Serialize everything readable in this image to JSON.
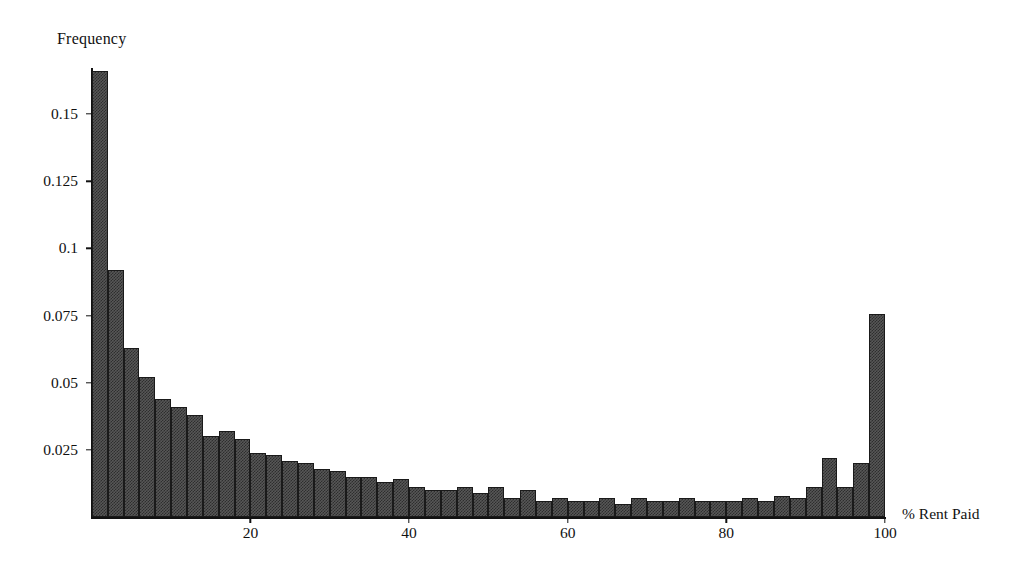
{
  "chart_data": {
    "type": "bar",
    "title": "Frequency",
    "subtitle": "",
    "xlabel": "% Rent Paid",
    "ylabel": "Frequency",
    "grid": false,
    "legend": "none",
    "xlim": [
      0,
      100
    ],
    "ylim": [
      0,
      0.175
    ],
    "xticks": [
      20,
      40,
      60,
      80,
      100
    ],
    "xtick_labels": [
      "20",
      "40",
      "60",
      "80",
      "100"
    ],
    "yticks": [
      0.025,
      0.05,
      0.075,
      0.1,
      0.125,
      0.15
    ],
    "ytick_labels": [
      "0.025",
      "0.05",
      "0.075",
      "0.1",
      "0.125",
      "0.15"
    ],
    "bin_width": 2,
    "bin_count": 50,
    "categories": [
      "0-2",
      "2-4",
      "4-6",
      "6-8",
      "8-10",
      "10-12",
      "12-14",
      "14-16",
      "16-18",
      "18-20",
      "20-22",
      "22-24",
      "24-26",
      "26-28",
      "28-30",
      "30-32",
      "32-34",
      "34-36",
      "36-38",
      "38-40",
      "40-42",
      "42-44",
      "44-46",
      "46-48",
      "48-50",
      "50-52",
      "52-54",
      "54-56",
      "56-58",
      "58-60",
      "60-62",
      "62-64",
      "64-66",
      "66-68",
      "68-70",
      "70-72",
      "72-74",
      "74-76",
      "76-78",
      "78-80",
      "80-82",
      "82-84",
      "84-86",
      "86-88",
      "88-90",
      "90-92",
      "92-94",
      "94-96",
      "96-98",
      "98-100"
    ],
    "values": [
      0.166,
      0.092,
      0.063,
      0.052,
      0.044,
      0.041,
      0.038,
      0.03,
      0.032,
      0.029,
      0.024,
      0.023,
      0.021,
      0.02,
      0.018,
      0.017,
      0.015,
      0.015,
      0.013,
      0.014,
      0.011,
      0.01,
      0.01,
      0.011,
      0.009,
      0.011,
      0.007,
      0.01,
      0.006,
      0.007,
      0.006,
      0.006,
      0.007,
      0.005,
      0.007,
      0.006,
      0.006,
      0.007,
      0.006,
      0.006,
      0.006,
      0.007,
      0.006,
      0.008,
      0.007,
      0.011,
      0.022,
      0.011,
      0.02,
      0.0755
    ]
  }
}
